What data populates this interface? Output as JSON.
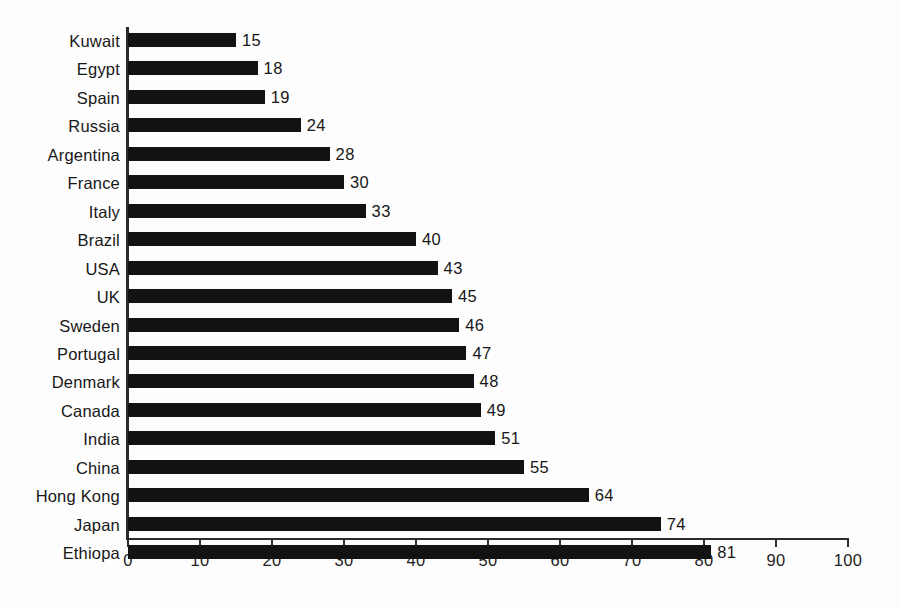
{
  "chart_data": {
    "type": "bar",
    "orientation": "horizontal",
    "title": "",
    "subtitle": "",
    "xlabel": "",
    "ylabel": "",
    "xlim": [
      0,
      100
    ],
    "xticks": [
      0,
      10,
      20,
      30,
      40,
      50,
      60,
      70,
      80,
      90,
      100
    ],
    "xtick_labels": [
      "0",
      "10",
      "20",
      "30",
      "40",
      "50",
      "60",
      "70",
      "80",
      "90",
      "100"
    ],
    "grid": false,
    "legend": false,
    "bar_color": "#121212",
    "axis_color": "#2b2b2b",
    "background_color": "#fdfdfd",
    "categories": [
      "Kuwait",
      "Egypt",
      "Spain",
      "Russia",
      "Argentina",
      "France",
      "Italy",
      "Brazil",
      "USA",
      "UK",
      "Sweden",
      "Portugal",
      "Denmark",
      "Canada",
      "India",
      "China",
      "Hong Kong",
      "Japan",
      "Ethiopa"
    ],
    "values": [
      15,
      18,
      19,
      24,
      28,
      30,
      33,
      40,
      43,
      45,
      46,
      47,
      48,
      49,
      51,
      55,
      64,
      74,
      81
    ],
    "data_labels": [
      "15",
      "18",
      "19",
      "24",
      "28",
      "30",
      "33",
      "40",
      "43",
      "45",
      "46",
      "47",
      "48",
      "49",
      "51",
      "55",
      "64",
      "74",
      "81"
    ]
  }
}
